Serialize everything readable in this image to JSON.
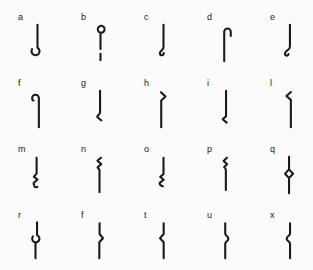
{
  "page": {
    "background_color": "#fbfbfb",
    "ink_color": "#1a1a1a"
  },
  "grid": {
    "rows": 4,
    "cols": 5
  },
  "cells": [
    {
      "label": "a",
      "icon": "stroke-with-open-ring-bottom-icon",
      "path": "M13 2 V27.2 A4.4 4.4 0 1 1 7 28.8"
    },
    {
      "label": "b",
      "icon": "ring-top-stem-and-dash-icon",
      "path": "M13 3.2 A3.8 3.8 0 1 0 13.05 3.19 M13 10.8 V28.5 M13 34 V41"
    },
    {
      "label": "c",
      "icon": "stroke-with-curled-tail-bottom-icon",
      "path": "M13 2 V26.5 C13 30.5 9 30.3 9 33.4 C9 36.4 13.3 36.1 13.3 33"
    },
    {
      "label": "d",
      "icon": "stroke-with-round-crook-top-right-icon",
      "path": "M10.5 42 V9.6 A3.6 3.6 0 0 1 17.7 9.6 V14.2"
    },
    {
      "label": "e",
      "icon": "stroke-with-round-hook-bottom-left-icon",
      "path": "M13.5 2 V26 C13.5 30.3 8 29.9 8 33.6 C8 36.5 11.4 36.7 11.9 34.2"
    },
    {
      "label": "f",
      "icon": "stroke-with-round-crook-top-left-icon",
      "path": "M14.5 42 V10 A3.7 3.7 0 0 0 7.1 10 Q7.1 12.8 8.6 12.7"
    },
    {
      "label": "g",
      "icon": "stroke-with-angled-tail-bottom-icon",
      "path": "M12.5 2 V25.5 C12.5 28.4 9.4 28.4 9.4 30.8 L14 34.6"
    },
    {
      "label": "h",
      "icon": "stroke-with-chevron-top-right-icon",
      "path": "M10.5 42 V12.6 L15.2 8.3 L10.2 3.6"
    },
    {
      "label": "i",
      "icon": "stroke-with-chevron-bottom-left-icon",
      "path": "M12.5 2 V30 L8.8 33.2 L13.2 37"
    },
    {
      "label": "l",
      "icon": "stroke-with-chevron-top-left-icon",
      "path": "M14.5 42 V12 L9.6 7.7 L14.6 3.3"
    },
    {
      "label": "m",
      "icon": "stroke-with-zigzag-lower-icon",
      "path": "M12 3 V20.5 L9 23.8 L13 27 L8.7 30.8 L9.3 33.6 Q10 36.4 12.9 35"
    },
    {
      "label": "n",
      "icon": "stroke-with-zigzag-upper-icon",
      "path": "M13.5 3 L9.6 6.4 L13.8 10 L9.8 13.5 L11.9 16.4 V41"
    },
    {
      "label": "o",
      "icon": "stroke-with-zigzag-bottom-icon",
      "path": "M13 3 V20.8 L9.4 24.2 L13.2 27.2 L8.7 30.6 Q9.1 33.8 12.3 34.4"
    },
    {
      "label": "p",
      "icon": "stroke-with-zigzag-top-icon",
      "path": "M13.5 3 L9.8 6.6 L13.7 10.2 L10.4 13.2 Q12.3 14.8 12.3 17.2 V38.5"
    },
    {
      "label": "q",
      "icon": "stroke-with-open-diamond-middle-icon",
      "path": "M12.5 2 V15.8 M12.5 15.8 L16.9 20.6 L12.5 25.4 L8.1 20.6 Z M12.5 25.4 V42"
    },
    {
      "label": "r",
      "icon": "stroke-with-open-ring-middle-icon",
      "path": "M12.5 1.5 V15.7 A4 4 0 1 1 8 17 M10.8 23.4 V41"
    },
    {
      "label": "f",
      "icon": "stroke-with-pointed-bump-right-icon",
      "path": "M12 2.5 V14.3 L15.7 18.9 L11.7 23.4 V41"
    },
    {
      "label": "t",
      "icon": "stroke-with-pointed-bump-left-icon",
      "path": "M13.2 2.5 V14.3 L9.2 18.9 L13.2 23.4 V41"
    },
    {
      "label": "u",
      "icon": "stroke-with-round-bump-right-icon",
      "path": "M11.6 2.5 V13.8 C11.6 16.4 15.1 16.7 15.1 19.4 C15.1 22.1 11.6 22.4 11.6 24.9 V41"
    },
    {
      "label": "x",
      "icon": "stroke-with-round-bump-left-icon",
      "path": "M13.6 2.5 V13.8 C13.6 16.4 9.9 16.7 9.9 19.4 C9.9 22.1 13.6 22.4 13.6 24.9 V41"
    }
  ]
}
